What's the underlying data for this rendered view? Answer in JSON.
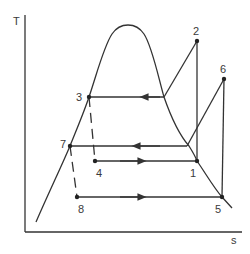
{
  "diagram": {
    "type": "T-s diagram (two-stage vapor compression cycle)",
    "axes": {
      "y_label": "T",
      "x_label": "s"
    },
    "points": [
      {
        "id": "1",
        "label": "1",
        "x": 197,
        "y": 161,
        "label_x": 190,
        "label_y": 176
      },
      {
        "id": "2",
        "label": "2",
        "x": 197,
        "y": 41,
        "label_x": 193,
        "label_y": 35
      },
      {
        "id": "3",
        "label": "3",
        "x": 89,
        "y": 97,
        "label_x": 77,
        "label_y": 101
      },
      {
        "id": "4",
        "label": "4",
        "x": 95,
        "y": 161,
        "label_x": 96,
        "label_y": 176
      },
      {
        "id": "5",
        "label": "5",
        "x": 222,
        "y": 197,
        "label_x": 215,
        "label_y": 212
      },
      {
        "id": "6",
        "label": "6",
        "x": 224,
        "y": 79,
        "label_x": 220,
        "label_y": 73
      },
      {
        "id": "7",
        "label": "7",
        "x": 70,
        "y": 146,
        "label_x": 60,
        "label_y": 147
      },
      {
        "id": "8",
        "label": "8",
        "x": 77,
        "y": 197,
        "label_x": 78,
        "label_y": 212
      }
    ],
    "colors": {
      "line": "#333333",
      "text": "#3a3a3a",
      "background": "#ffffff"
    }
  }
}
